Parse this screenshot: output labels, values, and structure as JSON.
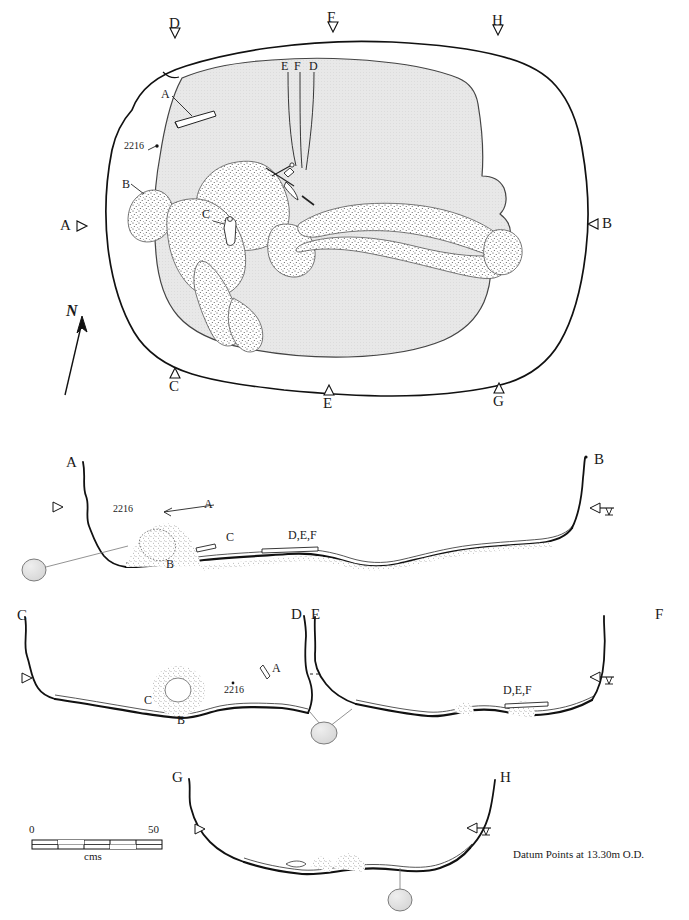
{
  "figure": {
    "type": "archaeological-plan-and-sections",
    "datum_note": "Datum Points at 13.30m O.D.",
    "north_label": "N",
    "context_number": "2216"
  },
  "scale_bar": {
    "start_label": "0",
    "end_label": "50",
    "unit_label": "cms",
    "segments": 5
  },
  "plan": {
    "name": "plan-view",
    "section_markers": [
      {
        "id": "marker-D-top",
        "label": "D",
        "x": 175,
        "y": 31,
        "dir": "down",
        "tx": 171,
        "ty": 20
      },
      {
        "id": "marker-F-top",
        "label": "F",
        "x": 333,
        "y": 25,
        "dir": "down",
        "tx": 329,
        "ty": 14
      },
      {
        "id": "marker-H-top",
        "label": "H",
        "x": 498,
        "y": 28,
        "dir": "down",
        "tx": 494,
        "ty": 17
      },
      {
        "id": "marker-A-left",
        "label": "A",
        "x": 79,
        "y": 226,
        "dir": "right",
        "tx": 62,
        "ty": 219
      },
      {
        "id": "marker-B-right",
        "label": "B",
        "x": 594,
        "y": 224,
        "dir": "left",
        "tx": 603,
        "ty": 217
      },
      {
        "id": "marker-C-bot",
        "label": "C",
        "x": 175,
        "y": 375,
        "dir": "up",
        "tx": 171,
        "ty": 380
      },
      {
        "id": "marker-E-bot",
        "label": "E",
        "x": 329,
        "y": 392,
        "dir": "up",
        "tx": 325,
        "ty": 397
      },
      {
        "id": "marker-G-bot",
        "label": "G",
        "x": 499,
        "y": 390,
        "dir": "up",
        "tx": 495,
        "ty": 395
      }
    ],
    "leader_labels": [
      {
        "id": "plan-label-E",
        "label": "E",
        "x": 282,
        "y": 63
      },
      {
        "id": "plan-label-F",
        "label": "F",
        "x": 295,
        "y": 63
      },
      {
        "id": "plan-label-D",
        "label": "D",
        "x": 310,
        "y": 63
      },
      {
        "id": "plan-label-A",
        "label": "A",
        "x": 163,
        "y": 92
      },
      {
        "id": "plan-label-B",
        "label": "B",
        "x": 124,
        "y": 182
      },
      {
        "id": "plan-label-C",
        "label": "C",
        "x": 204,
        "y": 212
      },
      {
        "id": "plan-context-2216",
        "label": "2216",
        "x": 126,
        "y": 146
      }
    ]
  },
  "sections": [
    {
      "id": "section-ab",
      "name": "section-A-B",
      "left_label": "A",
      "right_label": "B",
      "labels": [
        {
          "id": "sec-ab-2216",
          "label": "2216",
          "x": 115,
          "y": 508
        },
        {
          "id": "sec-ab-A",
          "label": "A",
          "x": 205,
          "y": 503
        },
        {
          "id": "sec-ab-B",
          "label": "B",
          "x": 168,
          "y": 562
        },
        {
          "id": "sec-ab-C",
          "label": "C",
          "x": 227,
          "y": 535
        },
        {
          "id": "sec-ab-def",
          "label": "D,E,F",
          "x": 306,
          "y": 532
        }
      ]
    },
    {
      "id": "section-cd",
      "name": "section-C-D",
      "left_label": "C",
      "right_label": "D",
      "labels": [
        {
          "id": "sec-cd-C",
          "label": "C",
          "x": 180,
          "y": 676
        },
        {
          "id": "sec-cd-B",
          "label": "B",
          "x": 185,
          "y": 716
        },
        {
          "id": "sec-cd-2216",
          "label": "2216",
          "x": 229,
          "y": 690
        },
        {
          "id": "sec-cd-A",
          "label": "A",
          "x": 274,
          "y": 670
        }
      ]
    },
    {
      "id": "section-ef",
      "name": "section-E-F",
      "left_label": "E",
      "right_label": "F",
      "labels": [
        {
          "id": "sec-ef-def",
          "label": "D,E,F",
          "x": 504,
          "y": 689
        }
      ]
    },
    {
      "id": "section-gh",
      "name": "section-G-H",
      "left_label": "G",
      "right_label": "H",
      "labels": []
    }
  ]
}
